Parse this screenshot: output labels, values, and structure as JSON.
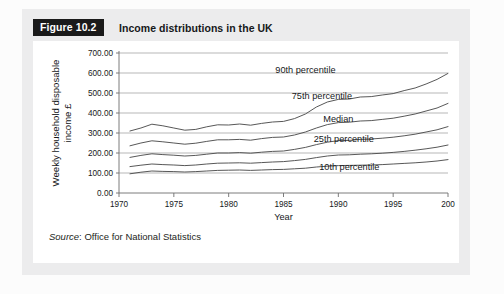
{
  "figure": {
    "tag": "Figure 10.2",
    "title": "Income distributions in the UK",
    "source_word": "Source",
    "source_rest": ": Office for National Statistics"
  },
  "chart_data": {
    "type": "line",
    "title": "Income distributions in the UK",
    "xlabel": "Year",
    "ylabel": "Weekly household disposable income £",
    "xlim": [
      1970,
      2000
    ],
    "ylim": [
      0,
      700
    ],
    "grid": true,
    "legend_position": "inline-right",
    "xticks": [
      "1970",
      "1975",
      "1980",
      "1985",
      "1990",
      "1995",
      "200"
    ],
    "xtick_values": [
      1970,
      1975,
      1980,
      1985,
      1990,
      1995,
      2000
    ],
    "yticks": [
      "0.00",
      "100.00",
      "200.00",
      "300.00",
      "400.00",
      "500.00",
      "600.00",
      "700.00"
    ],
    "ytick_values": [
      0,
      100,
      200,
      300,
      400,
      500,
      600,
      700
    ],
    "x": [
      1971,
      1972,
      1973,
      1974,
      1975,
      1976,
      1977,
      1978,
      1979,
      1980,
      1981,
      1982,
      1983,
      1984,
      1985,
      1986,
      1987,
      1988,
      1989,
      1990,
      1991,
      1992,
      1993,
      1994,
      1995,
      1996,
      1997,
      1998,
      1999,
      2000
    ],
    "series": [
      {
        "name": "90th percentile",
        "label": "90th percentile",
        "values": [
          310,
          325,
          344,
          336,
          325,
          314,
          318,
          331,
          341,
          340,
          345,
          339,
          348,
          355,
          358,
          372,
          395,
          430,
          455,
          468,
          470,
          480,
          482,
          490,
          497,
          512,
          525,
          545,
          568,
          598
        ]
      },
      {
        "name": "75th percentile",
        "label": "75th percentile",
        "values": [
          236,
          250,
          261,
          256,
          250,
          244,
          249,
          258,
          266,
          266,
          268,
          264,
          272,
          278,
          280,
          290,
          305,
          325,
          342,
          352,
          354,
          360,
          362,
          368,
          374,
          384,
          395,
          410,
          425,
          448
        ]
      },
      {
        "name": "Median",
        "label": "Median",
        "values": [
          178,
          188,
          196,
          192,
          189,
          185,
          188,
          194,
          200,
          200,
          202,
          199,
          204,
          208,
          210,
          218,
          228,
          242,
          254,
          262,
          263,
          268,
          270,
          274,
          279,
          286,
          294,
          305,
          316,
          332
        ]
      },
      {
        "name": "25th percentile",
        "label": "25th percentile",
        "values": [
          132,
          139,
          145,
          142,
          140,
          137,
          140,
          145,
          149,
          150,
          151,
          149,
          152,
          155,
          157,
          162,
          168,
          177,
          185,
          190,
          191,
          194,
          196,
          199,
          203,
          208,
          214,
          221,
          229,
          240
        ]
      },
      {
        "name": "10th percentile",
        "label": "10th percentile",
        "values": [
          96,
          104,
          110,
          108,
          107,
          105,
          107,
          110,
          113,
          114,
          115,
          113,
          115,
          117,
          118,
          121,
          124,
          130,
          134,
          137,
          138,
          139,
          140,
          142,
          145,
          148,
          151,
          155,
          160,
          167
        ]
      }
    ],
    "series_label_positions": [
      {
        "name": "90th percentile",
        "x": 1987.0,
        "y": 600
      },
      {
        "name": "75th percentile",
        "x": 1988.5,
        "y": 470
      },
      {
        "name": "Median",
        "x": 1990.0,
        "y": 355
      },
      {
        "name": "25th percentile",
        "x": 1990.5,
        "y": 255
      },
      {
        "name": "10th percentile",
        "x": 1991.0,
        "y": 115
      }
    ]
  }
}
